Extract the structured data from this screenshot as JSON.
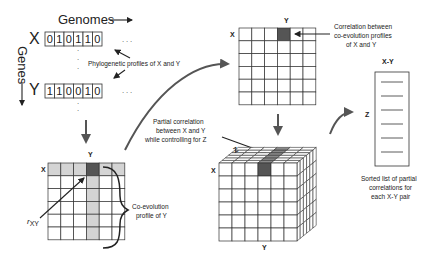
{
  "labels": {
    "genomes": "Genomes",
    "genes": "Genes",
    "x_gene": "X",
    "y_gene": "Y",
    "phylo_profiles": "Phylogenetic profiles of X and Y",
    "grid_x": "X",
    "grid_y": "Y",
    "rxy": "rXY",
    "coevo_line1": "Co-evolution",
    "coevo_line2": "profile of Y",
    "corr_x": "X",
    "corr_y": "Y",
    "corr_line1": "Correlation between",
    "corr_line2": "co-evolution profiles",
    "corr_line3": "of X and Y",
    "partial_line1": "Partial correlation",
    "partial_line2": "between X and Y",
    "partial_line3": "while controlling for Z",
    "cube_x": "X",
    "cube_y": "Y",
    "cube_z": "Z",
    "list_title": "X-Y",
    "list_z": "Z",
    "sorted_line1": "Sorted list of partial",
    "sorted_line2": "correlations for",
    "sorted_line3": "each X-Y pair"
  },
  "profiles": {
    "x_bits": [
      "0",
      "1",
      "0",
      "1",
      "1",
      "0"
    ],
    "y_bits": [
      "1",
      "1",
      "0",
      "0",
      "1",
      "0"
    ]
  },
  "grids": {
    "coevolution_matrix": {
      "rows": 6,
      "cols": 6,
      "highlight_row": 0,
      "highlight_col": 3
    },
    "correlation_matrix": {
      "rows": 6,
      "cols": 6,
      "highlight_row": 0,
      "highlight_col": 3
    },
    "cube": {
      "rows": 6,
      "cols": 6,
      "depth": 6,
      "highlight_col": 3
    }
  },
  "sorted_list": {
    "entries": 6
  },
  "colors": {
    "highlight_dark": "#555555",
    "highlight_light": "#d4d4d4",
    "line": "#333333",
    "arrow_gray": "#555555"
  }
}
